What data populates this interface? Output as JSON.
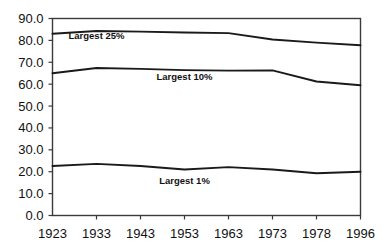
{
  "chart_data": {
    "type": "line",
    "title": "",
    "subtitle": "",
    "xlabel": "",
    "ylabel": "",
    "categories": [
      "1923",
      "1933",
      "1943",
      "1953",
      "1963",
      "1973",
      "1978",
      "1996"
    ],
    "x_tick_labels": [
      "1923",
      "1933",
      "1943",
      "1953",
      "1963",
      "1973",
      "1978",
      "1996"
    ],
    "y_tick_labels": [
      "0.0",
      "10.0",
      "20.0",
      "30.0",
      "40.0",
      "50.0",
      "60.0",
      "70.0",
      "80.0",
      "90.0"
    ],
    "y_ticks": [
      0,
      10,
      20,
      30,
      40,
      50,
      60,
      70,
      80,
      90
    ],
    "ylim": [
      0,
      90
    ],
    "grid": false,
    "legend": "inline-annotations",
    "legend_position": "inline",
    "series": [
      {
        "name": "Largest 25%",
        "values": [
          83.0,
          84.3,
          84.0,
          83.6,
          83.3,
          80.4,
          79.0,
          77.8
        ],
        "annotation": "Largest 25%"
      },
      {
        "name": "Largest 10%",
        "values": [
          65.0,
          67.4,
          67.0,
          66.4,
          66.2,
          66.3,
          61.2,
          59.5
        ],
        "annotation": "Largest 10%"
      },
      {
        "name": "Largest 1%",
        "values": [
          22.6,
          23.6,
          22.6,
          21.0,
          22.1,
          21.0,
          19.3,
          20.0
        ],
        "annotation": "Largest 1%"
      }
    ],
    "annotations": [
      {
        "text": "Largest 25%",
        "category_index": 1,
        "value": 80.5
      },
      {
        "text": "Largest 10%",
        "category_index": 3,
        "value": 62.0
      },
      {
        "text": "Largest 1%",
        "category_index": 3,
        "value": 14.5
      }
    ]
  },
  "colors": {
    "background": "#ffffff",
    "axis": "#3a3a3a",
    "line": "#1a1a1a",
    "text": "#111111"
  }
}
